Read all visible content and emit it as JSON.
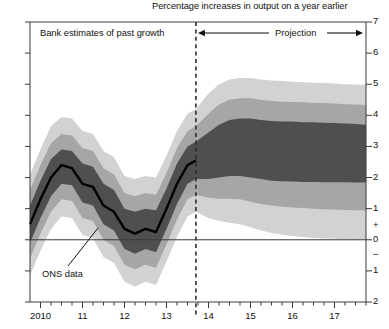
{
  "chart_data": {
    "type": "area",
    "title": "Percentage increases in output on a year earlier",
    "xlabel": "",
    "ylabel": "",
    "ylim": [
      -2,
      7
    ],
    "xlim": [
      2009.75,
      2017.75
    ],
    "grid": false,
    "legend_position": "none",
    "y_ticks": [
      "7",
      "6",
      "5",
      "4",
      "3",
      "2",
      "1",
      "+",
      "0",
      "–",
      "1",
      "2"
    ],
    "y_tick_values": [
      7,
      6,
      5,
      4,
      3,
      2,
      1,
      0,
      -1,
      -2
    ],
    "x_ticks": [
      "2010",
      "11",
      "12",
      "13",
      "14",
      "15",
      "16",
      "17"
    ],
    "x_tick_values": [
      2010,
      2011,
      2012,
      2013,
      2014,
      2015,
      2016,
      2017
    ],
    "minor_ticks_per_interval": 3,
    "zero_line": 0,
    "projection_start": 2013.7,
    "annotations": [
      {
        "name": "past-growth",
        "text": "Bank estimates of past growth"
      },
      {
        "name": "projection",
        "text": "Projection"
      },
      {
        "name": "ons-data",
        "text": "ONS data"
      }
    ],
    "colors": {
      "band_outer": "#d2d2d2",
      "band_mid": "#a6a6a6",
      "band_inner": "#4f4f4f",
      "line": "#000000",
      "axis": "#3a3a3a",
      "background": "#ffffff"
    },
    "series": [
      {
        "name": "ONS data (central line, past)",
        "x": [
          2009.75,
          2010.0,
          2010.25,
          2010.5,
          2010.75,
          2011.0,
          2011.25,
          2011.5,
          2011.75,
          2012.0,
          2012.25,
          2012.5,
          2012.75,
          2013.0,
          2013.25,
          2013.5,
          2013.7
        ],
        "values": [
          0.5,
          1.3,
          2.0,
          2.4,
          2.3,
          1.8,
          1.7,
          1.1,
          0.9,
          0.35,
          0.2,
          0.35,
          0.25,
          1.0,
          1.8,
          2.4,
          2.55
        ]
      },
      {
        "name": "Central projection (mode, median of fan)",
        "x": [
          2013.7,
          2014.0,
          2014.25,
          2014.5,
          2014.75,
          2015.0,
          2015.25,
          2015.5,
          2015.75,
          2016.0,
          2016.25,
          2016.5,
          2016.75,
          2017.0,
          2017.25,
          2017.5,
          2017.75
        ],
        "values": [
          2.55,
          2.7,
          2.85,
          2.95,
          2.95,
          2.9,
          2.85,
          2.8,
          2.78,
          2.78,
          2.78,
          2.78,
          2.78,
          2.78,
          2.78,
          2.78,
          2.78
        ]
      },
      {
        "name": "Inner band (30% probability) upper",
        "x": [
          2009.75,
          2010.0,
          2010.25,
          2010.5,
          2010.75,
          2011.0,
          2011.25,
          2011.5,
          2011.75,
          2012.0,
          2012.25,
          2012.5,
          2012.75,
          2013.0,
          2013.25,
          2013.5,
          2013.7,
          2014.0,
          2014.25,
          2014.5,
          2014.75,
          2015.0,
          2015.25,
          2015.5,
          2015.75,
          2016.0,
          2016.25,
          2016.5,
          2016.75,
          2017.0,
          2017.25,
          2017.5,
          2017.75
        ],
        "values": [
          1.1,
          1.9,
          2.6,
          2.9,
          2.85,
          2.45,
          2.35,
          1.8,
          1.6,
          1.0,
          0.9,
          1.0,
          0.95,
          1.65,
          2.45,
          3.0,
          3.15,
          3.45,
          3.7,
          3.85,
          3.9,
          3.9,
          3.85,
          3.82,
          3.8,
          3.8,
          3.78,
          3.78,
          3.76,
          3.75,
          3.74,
          3.72,
          3.7
        ]
      },
      {
        "name": "Inner band (30% probability) lower",
        "x": [
          2009.75,
          2010.0,
          2010.25,
          2010.5,
          2010.75,
          2011.0,
          2011.25,
          2011.5,
          2011.75,
          2012.0,
          2012.25,
          2012.5,
          2012.75,
          2013.0,
          2013.25,
          2013.5,
          2013.7,
          2014.0,
          2014.25,
          2014.5,
          2014.75,
          2015.0,
          2015.25,
          2015.5,
          2015.75,
          2016.0,
          2016.25,
          2016.5,
          2016.75,
          2017.0,
          2017.25,
          2017.5,
          2017.75
        ],
        "values": [
          -0.1,
          0.7,
          1.4,
          1.8,
          1.75,
          1.2,
          1.1,
          0.5,
          0.3,
          -0.3,
          -0.45,
          -0.3,
          -0.4,
          0.35,
          1.15,
          1.8,
          1.95,
          1.95,
          2.0,
          2.05,
          2.05,
          2.0,
          1.95,
          1.9,
          1.88,
          1.87,
          1.86,
          1.86,
          1.85,
          1.85,
          1.85,
          1.84,
          1.84
        ]
      },
      {
        "name": "Middle band (60% probability) upper",
        "x": [
          2009.75,
          2010.0,
          2010.25,
          2010.5,
          2010.75,
          2011.0,
          2011.25,
          2011.5,
          2011.75,
          2012.0,
          2012.25,
          2012.5,
          2012.75,
          2013.0,
          2013.25,
          2013.5,
          2013.7,
          2014.0,
          2014.25,
          2014.5,
          2014.75,
          2015.0,
          2015.25,
          2015.5,
          2015.75,
          2016.0,
          2016.25,
          2016.5,
          2016.75,
          2017.0,
          2017.25,
          2017.5,
          2017.75
        ],
        "values": [
          1.6,
          2.4,
          3.1,
          3.4,
          3.35,
          2.95,
          2.85,
          2.3,
          2.1,
          1.5,
          1.4,
          1.5,
          1.45,
          2.15,
          2.95,
          3.5,
          3.65,
          4.05,
          4.35,
          4.5,
          4.55,
          4.55,
          4.5,
          4.46,
          4.44,
          4.43,
          4.42,
          4.4,
          4.4,
          4.38,
          4.36,
          4.35,
          4.33
        ]
      },
      {
        "name": "Middle band (60% probability) lower",
        "x": [
          2009.75,
          2010.0,
          2010.25,
          2010.5,
          2010.75,
          2011.0,
          2011.25,
          2011.5,
          2011.75,
          2012.0,
          2012.25,
          2012.5,
          2012.75,
          2013.0,
          2013.25,
          2013.5,
          2013.7,
          2014.0,
          2014.25,
          2014.5,
          2014.75,
          2015.0,
          2015.25,
          2015.5,
          2015.75,
          2016.0,
          2016.25,
          2016.5,
          2016.75,
          2017.0,
          2017.25,
          2017.5,
          2017.75
        ],
        "values": [
          -0.6,
          0.2,
          0.9,
          1.3,
          1.25,
          0.7,
          0.6,
          0.0,
          -0.2,
          -0.8,
          -0.95,
          -0.8,
          -0.9,
          -0.15,
          0.65,
          1.3,
          1.45,
          1.35,
          1.32,
          1.32,
          1.3,
          1.22,
          1.15,
          1.1,
          1.06,
          1.04,
          1.02,
          1.0,
          0.98,
          0.97,
          0.96,
          0.95,
          0.94
        ]
      },
      {
        "name": "Outer band (90% probability) upper",
        "x": [
          2009.75,
          2010.0,
          2010.25,
          2010.5,
          2010.75,
          2011.0,
          2011.25,
          2011.5,
          2011.75,
          2012.0,
          2012.25,
          2012.5,
          2012.75,
          2013.0,
          2013.25,
          2013.5,
          2013.7,
          2014.0,
          2014.25,
          2014.5,
          2014.75,
          2015.0,
          2015.25,
          2015.5,
          2015.75,
          2016.0,
          2016.25,
          2016.5,
          2016.75,
          2017.0,
          2017.25,
          2017.5,
          2017.75
        ],
        "values": [
          2.1,
          2.9,
          3.65,
          3.95,
          3.9,
          3.5,
          3.4,
          2.85,
          2.65,
          2.05,
          1.95,
          2.05,
          2.0,
          2.7,
          3.5,
          4.05,
          4.2,
          4.7,
          5.0,
          5.15,
          5.2,
          5.2,
          5.15,
          5.12,
          5.1,
          5.08,
          5.06,
          5.05,
          5.04,
          5.02,
          5.0,
          4.99,
          4.98
        ]
      },
      {
        "name": "Outer band (90% probability) lower",
        "x": [
          2009.75,
          2010.0,
          2010.25,
          2010.5,
          2010.75,
          2011.0,
          2011.25,
          2011.5,
          2011.75,
          2012.0,
          2012.25,
          2012.5,
          2012.75,
          2013.0,
          2013.25,
          2013.5,
          2013.7,
          2014.0,
          2014.25,
          2014.5,
          2014.75,
          2015.0,
          2015.25,
          2015.5,
          2015.75,
          2016.0,
          2016.25,
          2016.5,
          2016.75,
          2017.0,
          2017.25,
          2017.5,
          2017.75
        ],
        "values": [
          -1.15,
          -0.35,
          0.35,
          0.75,
          0.7,
          0.15,
          0.05,
          -0.55,
          -0.75,
          -1.35,
          -1.5,
          -1.35,
          -1.45,
          -0.7,
          0.1,
          0.75,
          0.9,
          0.7,
          0.6,
          0.55,
          0.5,
          0.4,
          0.3,
          0.22,
          0.16,
          0.12,
          0.09,
          0.06,
          0.04,
          0.03,
          0.02,
          0.01,
          0.0
        ]
      }
    ]
  }
}
